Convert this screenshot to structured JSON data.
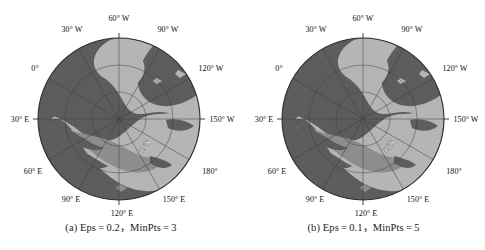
{
  "figure": {
    "panels": [
      {
        "id": "panel-a",
        "caption": "(a) Eps = 0.2，MinPts = 3",
        "map": {
          "type": "polar-stereographic-north",
          "center_label": "",
          "latitude_labels": [
            {
              "text": "60°N",
              "lat": 60
            }
          ],
          "longitude_labels": [
            {
              "text": "60° W",
              "lon": -60
            },
            {
              "text": "30° W",
              "lon": -30
            },
            {
              "text": "0°",
              "lon": 0
            },
            {
              "text": "30° E",
              "lon": 30
            },
            {
              "text": "60° E",
              "lon": 60
            },
            {
              "text": "90° E",
              "lon": 90
            },
            {
              "text": "120° E",
              "lon": 120
            },
            {
              "text": "150° E",
              "lon": 150
            },
            {
              "text": "180°",
              "lon": 180
            },
            {
              "text": "150° W",
              "lon": -150
            },
            {
              "text": "120° W",
              "lon": -120
            },
            {
              "text": "90° W",
              "lon": -90
            }
          ]
        }
      },
      {
        "id": "panel-b",
        "caption": "(b) Eps = 0.1，MinPts = 5",
        "map": {
          "type": "polar-stereographic-north",
          "center_label": "",
          "latitude_labels": [
            {
              "text": "60°N",
              "lat": 60
            }
          ],
          "longitude_labels": [
            {
              "text": "60° W",
              "lon": -60
            },
            {
              "text": "30° W",
              "lon": -30
            },
            {
              "text": "0°",
              "lon": 0
            },
            {
              "text": "30° E",
              "lon": 30
            },
            {
              "text": "60° E",
              "lon": 60
            },
            {
              "text": "90° E",
              "lon": 90
            },
            {
              "text": "120° E",
              "lon": 120
            },
            {
              "text": "150° E",
              "lon": 150
            },
            {
              "text": "180°",
              "lon": 180
            },
            {
              "text": "150° W",
              "lon": -150
            },
            {
              "text": "120° W",
              "lon": -120
            },
            {
              "text": "90° W",
              "lon": -90
            }
          ]
        }
      }
    ],
    "colors": {
      "background": "#ffffff",
      "dark_region": "#5d5d5d",
      "light_region": "#b6b6b6",
      "mid_region": "#8f8f8f",
      "graticule": "#3c3c3c",
      "outline": "#2e2e2e",
      "text": "#111111"
    }
  }
}
